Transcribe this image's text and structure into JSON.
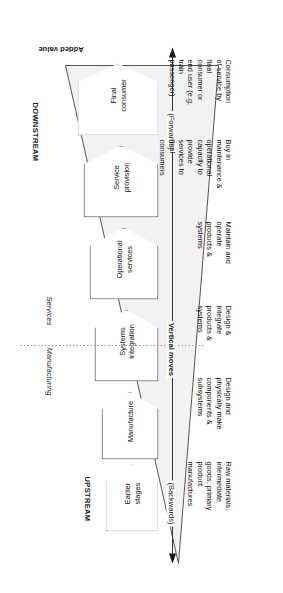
{
  "figure": {
    "title_added_value": "Added value",
    "upstream_label": "UPSTREAM",
    "downstream_label": "DOWNSTREAM",
    "manufacturing_label": "Manufacturing",
    "services_label": "Services",
    "vertical_moves_label": "Vertical moves",
    "backwards_label": "(Backwards)",
    "forwards_label": "(Forwards)"
  },
  "stages": [
    {
      "id": "earlier-stages",
      "label": "Earlier\nstages",
      "style": "dotted"
    },
    {
      "id": "manufacture",
      "label": "Manufacture",
      "style": "solid"
    },
    {
      "id": "systems-integration",
      "label": "Systems\nintegration",
      "style": "solid"
    },
    {
      "id": "operational-services",
      "label": "Operational\nservices",
      "style": "solid"
    },
    {
      "id": "service-provision",
      "label": "Service\nprovision",
      "style": "solid"
    },
    {
      "id": "final-consumer",
      "label": "Final\nconsumer",
      "style": "dotted"
    }
  ],
  "descriptions": [
    {
      "id": "desc-earlier-stages",
      "text": "Raw materials,\nintermediate\ngoods, primary\nproduct\nmanufactures"
    },
    {
      "id": "desc-manufacture",
      "text": "Design and\nphysically make\ncomponents &\nsubsystems"
    },
    {
      "id": "desc-systems",
      "text": "Design &\nintegrate\nproducts &\nsystems"
    },
    {
      "id": "desc-operational",
      "text": "Maintain and\noperate\nproducts &\nsystems"
    },
    {
      "id": "desc-service",
      "text": "Buy in\nmaintenance &\noperational\ncapacity to\nprovide\nservices to\nfinal\nconsumers"
    },
    {
      "id": "desc-final-consumer",
      "text": "Consumption\nof service by\nfinal\nconsumer or\nend user (e.g.\ntrain\npassenger)"
    }
  ],
  "colors": {
    "wedge_fill": "#f2f2f2",
    "wedge_stroke": "#555555",
    "box_stroke": "#4b4b4b",
    "dotted_stroke": "#8e8e8e",
    "text": "#111111",
    "divider": "#999999"
  }
}
